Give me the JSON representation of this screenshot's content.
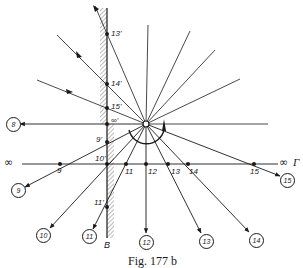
{
  "figure": {
    "caption": "Fig. 177 b",
    "wall_label": "B",
    "axis_label_left": "∞",
    "axis_label_right": "∞",
    "axis_name": "Γ"
  },
  "wall_points": [
    {
      "id": "13p",
      "label": "13'"
    },
    {
      "id": "14p",
      "label": "14'"
    },
    {
      "id": "15p",
      "label": "15'"
    },
    {
      "id": "infp",
      "label": "∞'"
    },
    {
      "id": "9p",
      "label": "9'"
    },
    {
      "id": "10p",
      "label": "10'"
    },
    {
      "id": "11p",
      "label": "11'"
    }
  ],
  "axis_points": [
    {
      "id": "9",
      "label": "9"
    },
    {
      "id": "11",
      "label": "11"
    },
    {
      "id": "12",
      "label": "12"
    },
    {
      "id": "13",
      "label": "13"
    },
    {
      "id": "14",
      "label": "14"
    },
    {
      "id": "15",
      "label": "15"
    }
  ],
  "circled_labels": [
    {
      "id": "8",
      "label": "8"
    },
    {
      "id": "9",
      "label": "9"
    },
    {
      "id": "10",
      "label": "10"
    },
    {
      "id": "11",
      "label": "11"
    },
    {
      "id": "12",
      "label": "12"
    },
    {
      "id": "13",
      "label": "13"
    },
    {
      "id": "14",
      "label": "14"
    },
    {
      "id": "15",
      "label": "15"
    }
  ],
  "colors": {
    "ink": "#1a1a1a",
    "background": "#ffffff"
  }
}
